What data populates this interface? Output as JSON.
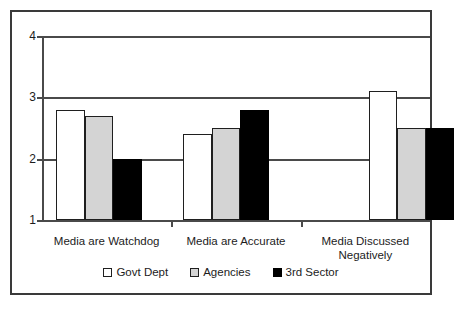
{
  "chart_data": {
    "type": "bar",
    "title": "",
    "subtitle": "",
    "xlabel": "",
    "ylabel": "",
    "categories": [
      "Media are Watchdog",
      "Media are Accurate",
      "Media Discussed Negatively"
    ],
    "category_lines": [
      [
        "Media are Watchdog"
      ],
      [
        "Media are Accurate"
      ],
      [
        "Media  Discussed",
        "Negatively"
      ]
    ],
    "series": [
      {
        "name": "Govt Dept",
        "color": "#ffffff",
        "values": [
          2.8,
          2.4,
          3.1
        ]
      },
      {
        "name": "Agencies",
        "color": "#d4d4d4",
        "values": [
          2.7,
          2.5,
          2.5
        ]
      },
      {
        "name": "3rd Sector",
        "color": "#000000",
        "values": [
          2.0,
          2.8,
          2.5
        ]
      }
    ],
    "ylim": [
      1,
      4
    ],
    "yticks": [
      1,
      2,
      3,
      4
    ],
    "ytick_labels": [
      "1",
      "2",
      "3",
      "4"
    ],
    "grid": true,
    "grid_axis": "y",
    "legend_position": "bottom",
    "legend_entries": [
      "Govt Dept",
      "Agencies",
      "3rd Sector"
    ],
    "border_color": "#3a3a3a",
    "axis_color": "#4a4a4a",
    "bar_outline_color": "#1f1f1f",
    "background": "#ffffff"
  }
}
